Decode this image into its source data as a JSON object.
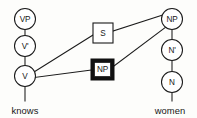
{
  "diagram": {
    "type": "syntax-tree-derivation",
    "background_color": "#fdfdfb",
    "line_color": "#1a1a1a",
    "highlight_color": "#111111",
    "left_tree": {
      "terminal": "knows",
      "nodes": [
        {
          "id": "vp",
          "label": "VP",
          "shape": "circle",
          "cx": 25,
          "cy": 19,
          "r": 10.5
        },
        {
          "id": "vbar",
          "label": "V'",
          "shape": "circle",
          "cx": 25,
          "cy": 46,
          "r": 10.5
        },
        {
          "id": "v",
          "label": "V",
          "shape": "circle",
          "cx": 25,
          "cy": 76,
          "r": 10.5
        }
      ]
    },
    "right_tree": {
      "terminal": "women",
      "nodes": [
        {
          "id": "np-right",
          "label": "NP",
          "shape": "circle",
          "cx": 172,
          "cy": 19,
          "r": 10.5
        },
        {
          "id": "nbar",
          "label": "N'",
          "shape": "circle",
          "cx": 172,
          "cy": 50,
          "r": 10.5
        },
        {
          "id": "n",
          "label": "N",
          "shape": "circle",
          "cx": 172,
          "cy": 82,
          "r": 10.5
        }
      ]
    },
    "center_boxes": [
      {
        "id": "s-box",
        "label": "S",
        "style": "plain",
        "x": 93,
        "y": 23,
        "w": 20,
        "h": 20
      },
      {
        "id": "np-box",
        "label": "NP",
        "style": "highlighted",
        "x": 91,
        "y": 59,
        "w": 23,
        "h": 21
      }
    ],
    "edges": [
      {
        "id": "edge-vp-vbar",
        "from": "vp",
        "to": "vbar"
      },
      {
        "id": "edge-vbar-v",
        "from": "vbar",
        "to": "v"
      },
      {
        "id": "edge-v-knows",
        "from": "v",
        "to": "knows"
      },
      {
        "id": "edge-v-s",
        "from": "v",
        "to": "s-box"
      },
      {
        "id": "edge-v-npbox",
        "from": "v",
        "to": "np-box"
      },
      {
        "id": "edge-s-npright",
        "from": "s-box",
        "to": "np-right"
      },
      {
        "id": "edge-npbox-npright",
        "from": "np-box",
        "to": "np-right"
      },
      {
        "id": "edge-npright-nbar",
        "from": "np-right",
        "to": "nbar"
      },
      {
        "id": "edge-nbar-n",
        "from": "nbar",
        "to": "n"
      },
      {
        "id": "edge-n-women",
        "from": "n",
        "to": "women"
      }
    ],
    "terminal_labels": [
      {
        "id": "knows-label",
        "text": "knows",
        "x": 25,
        "y": 112
      },
      {
        "id": "women-label",
        "text": "women",
        "x": 170,
        "y": 112
      }
    ]
  }
}
